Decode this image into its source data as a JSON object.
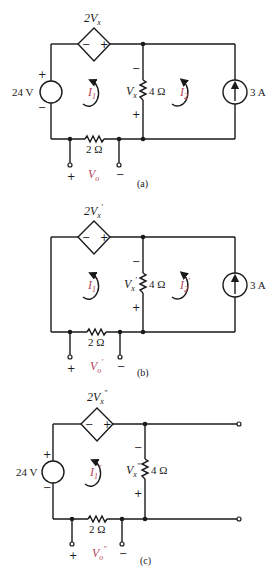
{
  "figure": {
    "panels": [
      {
        "id": "a",
        "caption": "(a)",
        "dep_source": {
          "label_main": "2V",
          "label_sub": "x",
          "label_prime": "",
          "minus": "−",
          "plus": "+"
        },
        "voltage_source": {
          "label": "24 V",
          "plus": "+",
          "minus": "−"
        },
        "mesh1": {
          "main": "I",
          "sub": "1",
          "prime": ""
        },
        "mesh2": {
          "main": "I",
          "sub": "2",
          "prime": ""
        },
        "resistor_4": {
          "label": "4 Ω",
          "vlabel_main": "V",
          "vlabel_sub": "x",
          "vlabel_prime": "",
          "minus": "−",
          "plus": "+"
        },
        "resistor_2": {
          "label": "2 Ω"
        },
        "current_source": {
          "label": "3 A"
        },
        "output": {
          "main": "V",
          "sub": "o",
          "prime": "",
          "plus": "+",
          "minus": "−"
        }
      },
      {
        "id": "b",
        "caption": "(b)",
        "dep_source": {
          "label_main": "2V",
          "label_sub": "x",
          "label_prime": "′",
          "minus": "−",
          "plus": "+"
        },
        "mesh1": {
          "main": "I",
          "sub": "1",
          "prime": "′"
        },
        "mesh2": {
          "main": "I",
          "sub": "2",
          "prime": "′"
        },
        "resistor_4": {
          "label": "4 Ω",
          "vlabel_main": "V",
          "vlabel_sub": "x",
          "vlabel_prime": "′",
          "minus": "−",
          "plus": "+"
        },
        "resistor_2": {
          "label": "2 Ω"
        },
        "current_source": {
          "label": "3 A"
        },
        "output": {
          "main": "V",
          "sub": "o",
          "prime": "′",
          "plus": "+",
          "minus": "−"
        }
      },
      {
        "id": "c",
        "caption": "(c)",
        "dep_source": {
          "label_main": "2V",
          "label_sub": "x",
          "label_prime": "″",
          "minus": "−",
          "plus": "+"
        },
        "voltage_source": {
          "label": "24 V",
          "plus": "+",
          "minus": "−"
        },
        "mesh1": {
          "main": "I",
          "sub": "1",
          "prime": "″"
        },
        "resistor_4": {
          "label": "4 Ω",
          "vlabel_main": "V",
          "vlabel_sub": "x",
          "vlabel_prime": "″",
          "minus": "−",
          "plus": "+"
        },
        "resistor_2": {
          "label": "2 Ω"
        },
        "output": {
          "main": "V",
          "sub": "o",
          "prime": "″",
          "plus": "+",
          "minus": "−"
        }
      }
    ],
    "colors": {
      "wire": "#1a1a1a",
      "current_label": "#b5455a"
    }
  }
}
